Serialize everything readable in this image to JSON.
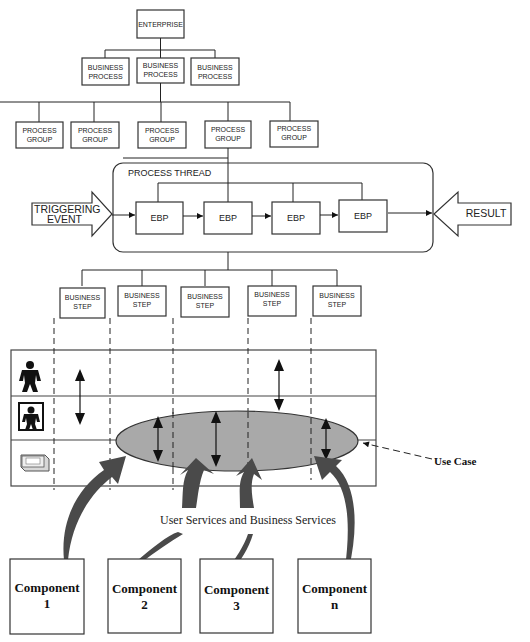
{
  "hierarchy": {
    "enterprise": "ENTERPRISE",
    "business_processes": [
      [
        "BUSINESS",
        "PROCESS"
      ],
      [
        "BUSINESS",
        "PROCESS"
      ],
      [
        "BUSINESS",
        "PROCESS"
      ]
    ],
    "process_groups": [
      [
        "PROCESS",
        "GROUP"
      ],
      [
        "PROCESS",
        "GROUP"
      ],
      [
        "PROCESS",
        "GROUP"
      ],
      [
        "PROCESS",
        "GROUP"
      ],
      [
        "PROCESS",
        "GROUP"
      ]
    ]
  },
  "process_thread": {
    "title": "PROCESS THREAD",
    "trigger": [
      "TRIGGERING",
      "EVENT"
    ],
    "result": "RESULT",
    "ebps": [
      "EBP",
      "EBP",
      "EBP",
      "EBP"
    ]
  },
  "business_steps": [
    [
      "BUSINESS",
      "STEP"
    ],
    [
      "BUSINESS",
      "STEP"
    ],
    [
      "BUSINESS",
      "STEP"
    ],
    [
      "BUSINESS",
      "STEP"
    ],
    [
      "BUSINESS",
      "STEP"
    ]
  ],
  "lanes": {
    "icons": [
      "user-figure-icon",
      "user-interface-figure-icon",
      "computer-icon"
    ]
  },
  "use_case_label": "Use Case",
  "services_label": "User Services and Business Services",
  "components": [
    [
      "Component",
      "1"
    ],
    [
      "Component",
      "2"
    ],
    [
      "Component",
      "3"
    ],
    [
      "Component",
      "n"
    ]
  ],
  "colors": {
    "ellipse_fill": "#a9a9a9",
    "arrow_fill": "#4a4a4a",
    "line": "#222222"
  }
}
